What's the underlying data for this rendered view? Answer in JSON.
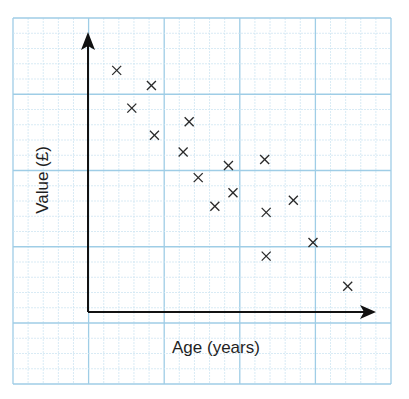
{
  "chart_data": {
    "type": "scatter",
    "title": "",
    "xlabel": "Age (years)",
    "ylabel": "Value (£)",
    "tick_labels": {
      "x": [],
      "y": []
    },
    "grid": true,
    "legend": null,
    "units_note": "values in minor grid squares measured from axis origin (no numeric ticks shown)",
    "xlim": [
      0,
      19
    ],
    "ylim": [
      0,
      18
    ],
    "points": [
      {
        "x": 1.9,
        "y": 16.0
      },
      {
        "x": 4.2,
        "y": 15.0
      },
      {
        "x": 2.9,
        "y": 13.5
      },
      {
        "x": 6.7,
        "y": 12.6
      },
      {
        "x": 4.4,
        "y": 11.7
      },
      {
        "x": 6.3,
        "y": 10.6
      },
      {
        "x": 7.3,
        "y": 8.9
      },
      {
        "x": 9.3,
        "y": 9.7
      },
      {
        "x": 11.7,
        "y": 10.1
      },
      {
        "x": 9.6,
        "y": 7.9
      },
      {
        "x": 8.4,
        "y": 7.0
      },
      {
        "x": 13.6,
        "y": 7.4
      },
      {
        "x": 11.8,
        "y": 6.6
      },
      {
        "x": 11.8,
        "y": 3.7
      },
      {
        "x": 14.9,
        "y": 4.6
      },
      {
        "x": 17.2,
        "y": 1.7
      }
    ]
  },
  "colors": {
    "grid_minor": "#cfe6f3",
    "grid_major": "#9fcde6",
    "axis": "#111111",
    "marker": "#2a2a2a",
    "text": "#1f1f1f"
  }
}
